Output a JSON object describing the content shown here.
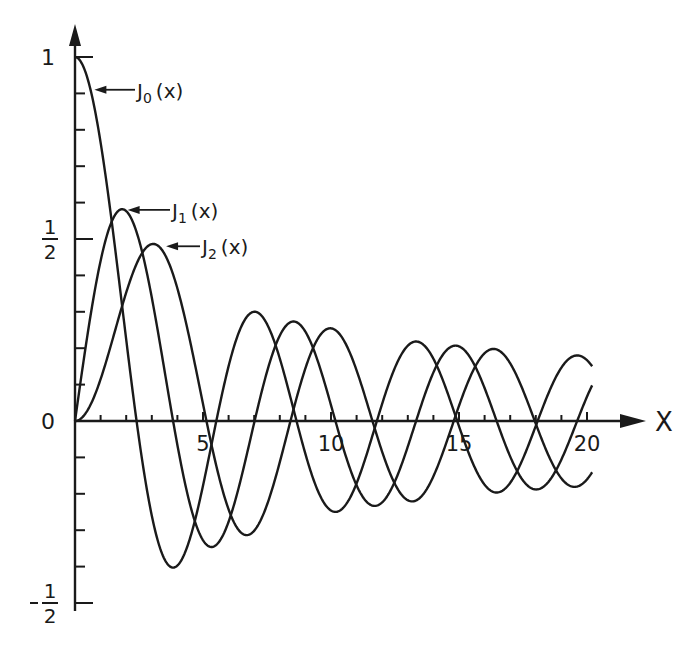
{
  "chart_data": {
    "type": "line",
    "title": "",
    "xlabel": "X",
    "ylabel": "",
    "xlim": [
      0,
      22
    ],
    "ylim": [
      -0.5,
      1
    ],
    "grid": false,
    "x_ticks": [
      {
        "value": 5,
        "label": "5"
      },
      {
        "value": 10,
        "label": "10"
      },
      {
        "value": 15,
        "label": "15"
      },
      {
        "value": 20,
        "label": "20"
      }
    ],
    "x_minor_step": 1,
    "y_ticks": [
      {
        "value": 1,
        "label": "1"
      },
      {
        "value": 0.5,
        "label": "1/2"
      },
      {
        "value": 0,
        "label": "0"
      },
      {
        "value": -0.5,
        "label": "-1/2"
      }
    ],
    "y_minor_step": 0.1,
    "x_range_plotted": [
      0,
      20.2
    ],
    "series": [
      {
        "name": "J0(x)",
        "order": 0,
        "label": "J",
        "subscript": "0",
        "suffix": "(x)",
        "peak": [
          0,
          1.0
        ],
        "first_zero": 2.405
      },
      {
        "name": "J1(x)",
        "order": 1,
        "label": "J",
        "subscript": "1",
        "suffix": "(x)",
        "peak": [
          1.84,
          0.582
        ],
        "first_zero": 3.832
      },
      {
        "name": "J2(x)",
        "order": 2,
        "label": "J",
        "subscript": "2",
        "suffix": "(x)",
        "peak": [
          3.05,
          0.486
        ],
        "first_zero": 5.136
      }
    ],
    "annotations": [
      {
        "text": "J0(x)",
        "points_to": [
          0.6,
          0.91
        ]
      },
      {
        "text": "J1(x)",
        "points_to": [
          1.9,
          0.58
        ]
      },
      {
        "text": "J2(x)",
        "points_to": [
          3.4,
          0.48
        ]
      }
    ],
    "colors": {
      "line": "#1a1a1a",
      "background": "#ffffff"
    }
  }
}
